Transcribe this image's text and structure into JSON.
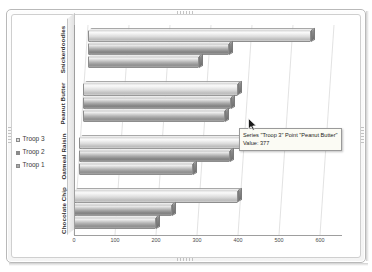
{
  "window": {
    "frame_style": "double-rounded-bezel",
    "background_color": "#ffffff"
  },
  "legend": {
    "position": "left-middle",
    "items": [
      {
        "label": "Troop 3",
        "swatch_color": "#dcdcdc",
        "icon": "square-swatch-icon"
      },
      {
        "label": "Troop 2",
        "swatch_color": "#8c8c8c",
        "icon": "square-swatch-icon"
      },
      {
        "label": "Troop 1",
        "swatch_color": "#a8a8a8",
        "icon": "square-swatch-icon"
      }
    ]
  },
  "tooltip": {
    "visible": true,
    "line1": "Series \"Troop 3\" Point \"Peanut Butter\"",
    "line2": "Value: 377",
    "series_name": "Troop 3",
    "point_name": "Peanut Butter",
    "value": 377,
    "background_color": "#fbfbf4",
    "border_color": "#9a9a9a"
  },
  "cursor": {
    "icon": "mouse-pointer-icon",
    "visible": true
  },
  "chart_data": {
    "type": "bar",
    "orientation": "horizontal",
    "style": "3d-cylinder",
    "title": "",
    "subtitle": "",
    "xlabel": "",
    "ylabel": "",
    "xlim": [
      0,
      600
    ],
    "grid": true,
    "grid_axis": "x",
    "legend_position": "left",
    "categories": [
      "Chocolate Chip",
      "Oatmeal Raisin",
      "Peanut Butter",
      "Snickerdoodles"
    ],
    "category_order_top_to_bottom": [
      "Snickerdoodles",
      "Peanut Butter",
      "Oatmeal Raisin",
      "Chocolate Chip"
    ],
    "xticks": [
      0,
      100,
      200,
      300,
      400,
      500,
      600
    ],
    "xtick_labels": [
      "0",
      "100",
      "200",
      "300",
      "400",
      "500",
      "600"
    ],
    "series": [
      {
        "name": "Troop 1",
        "color": "#a8a8a8",
        "values": [
          200,
          280,
          345,
          270
        ]
      },
      {
        "name": "Troop 2",
        "color": "#8c8c8c",
        "values": [
          240,
          370,
          360,
          345
        ]
      },
      {
        "name": "Troop 3",
        "color": "#dcdcdc",
        "values": [
          400,
          565,
          377,
          545
        ]
      }
    ]
  }
}
